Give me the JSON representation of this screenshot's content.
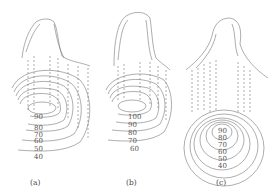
{
  "figure": {
    "panels": [
      {
        "id": "a",
        "caption": "(a)",
        "contour_labels": [
          "90",
          "80",
          "70",
          "60",
          "50",
          "40"
        ]
      },
      {
        "id": "b",
        "caption": "(b)",
        "contour_labels": [
          "100",
          "90",
          "80",
          "70",
          "60"
        ]
      },
      {
        "id": "c",
        "caption": "(c)",
        "contour_labels": [
          "90",
          "80",
          "70",
          "60",
          "50",
          "40"
        ]
      }
    ]
  }
}
